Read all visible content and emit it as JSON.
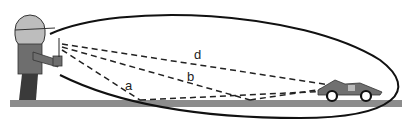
{
  "diagram": {
    "labels": {
      "a": "a",
      "b": "b",
      "d": "d"
    },
    "colors": {
      "ground": "#8c8c8c",
      "head": "#bdbdbd",
      "body": "#6e6e6e",
      "legs": "#3a3a3a",
      "lines": "#222222",
      "car": "#707070"
    }
  }
}
